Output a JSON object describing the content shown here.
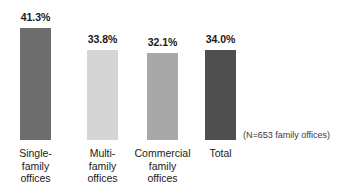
{
  "chart_data": {
    "type": "bar",
    "title": "",
    "subtitle": "",
    "xlabel": "",
    "ylabel": "",
    "ylim": [
      0,
      41.3
    ],
    "grid": false,
    "legend": "none",
    "orientation": "vertical",
    "categories": [
      "Single-family offices",
      "Multi-family offices",
      "Commercial family offices",
      "Total"
    ],
    "values": [
      41.3,
      33.8,
      32.1,
      34.0
    ],
    "value_labels": [
      "41.3%",
      "33.8%",
      "32.1%",
      "34.0%"
    ],
    "colors": [
      "#6e6e6e",
      "#d5d5d5",
      "#a8a8a8",
      "#4f4f4f"
    ],
    "annotations": [
      "(N=653 family offices)"
    ]
  },
  "bars": [
    {
      "label_lines": [
        "Single-",
        "family",
        "offices"
      ],
      "value_label": "41.3%",
      "value": 41.3,
      "color": "#6e6e6e",
      "left_px": 20,
      "width_px": 31,
      "height_px": 112
    },
    {
      "label_lines": [
        "Multi-",
        "family",
        "offices"
      ],
      "value_label": "33.8%",
      "value": 33.8,
      "color": "#d5d5d5",
      "left_px": 87,
      "width_px": 31,
      "height_px": 90
    },
    {
      "label_lines": [
        "Commercial",
        "family",
        "offices"
      ],
      "value_label": "32.1%",
      "value": 32.1,
      "color": "#a8a8a8",
      "left_px": 147,
      "width_px": 31,
      "height_px": 87
    },
    {
      "label_lines": [
        "Total",
        "",
        ""
      ],
      "value_label": "34.0%",
      "value": 34.0,
      "color": "#4f4f4f",
      "left_px": 205,
      "width_px": 31,
      "height_px": 90
    }
  ],
  "note": {
    "sample_size_text": "(N=653 family offices)"
  }
}
